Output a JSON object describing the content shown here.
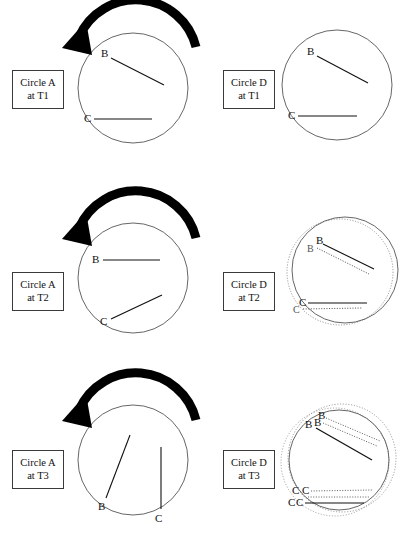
{
  "figure": {
    "title_present": false,
    "background": "#ffffff",
    "ink": "#111111",
    "circle_stroke": "#555555",
    "ghost_stroke": "#777777",
    "arrow_color": "#000000",
    "point_labels": {
      "b": "B",
      "c": "C"
    }
  },
  "rows": [
    {
      "id": "t1",
      "left_panel": {
        "box": {
          "line1": "Circle A",
          "line2": "at T1"
        },
        "circle_name": "Circle A",
        "time": "T1",
        "has_rotation_arrow": true,
        "arrow_direction": "counter-clockwise",
        "chords": [
          {
            "label": "B",
            "style": "solid"
          },
          {
            "label": "C",
            "style": "solid"
          }
        ]
      },
      "right_panel": {
        "box": {
          "line1": "Circle D",
          "line2": "at T1"
        },
        "circle_name": "Circle D",
        "time": "T1",
        "has_rotation_arrow": false,
        "ghost_circles": 0,
        "chords": [
          {
            "label": "B",
            "style": "solid"
          },
          {
            "label": "C",
            "style": "solid"
          }
        ]
      }
    },
    {
      "id": "t2",
      "left_panel": {
        "box": {
          "line1": "Circle A",
          "line2": "at T2"
        },
        "circle_name": "Circle A",
        "time": "T2",
        "has_rotation_arrow": true,
        "arrow_direction": "counter-clockwise",
        "chords": [
          {
            "label": "B",
            "style": "solid"
          },
          {
            "label": "C",
            "style": "solid"
          }
        ]
      },
      "right_panel": {
        "box": {
          "line1": "Circle D",
          "line2": "at T2"
        },
        "circle_name": "Circle D",
        "time": "T2",
        "has_rotation_arrow": false,
        "ghost_circles": 1,
        "chords": [
          {
            "label": "B",
            "style": "solid"
          },
          {
            "label": "B",
            "style": "dotted"
          },
          {
            "label": "C",
            "style": "solid"
          },
          {
            "label": "C",
            "style": "dotted"
          }
        ]
      }
    },
    {
      "id": "t3",
      "left_panel": {
        "box": {
          "line1": "Circle A",
          "line2": "at T3"
        },
        "circle_name": "Circle A",
        "time": "T3",
        "has_rotation_arrow": true,
        "arrow_direction": "counter-clockwise",
        "chords": [
          {
            "label": "B",
            "style": "solid"
          },
          {
            "label": "C",
            "style": "solid"
          }
        ]
      },
      "right_panel": {
        "box": {
          "line1": "Circle D",
          "line2": "at T3"
        },
        "circle_name": "Circle D",
        "time": "T3",
        "has_rotation_arrow": false,
        "ghost_circles": 2,
        "chords": [
          {
            "label": "B",
            "style": "solid"
          },
          {
            "label": "B",
            "style": "dotted"
          },
          {
            "label": "B",
            "style": "dotted"
          },
          {
            "label": "C",
            "style": "solid"
          },
          {
            "label": "C",
            "style": "dotted"
          },
          {
            "label": "C",
            "style": "dotted"
          }
        ]
      }
    }
  ]
}
